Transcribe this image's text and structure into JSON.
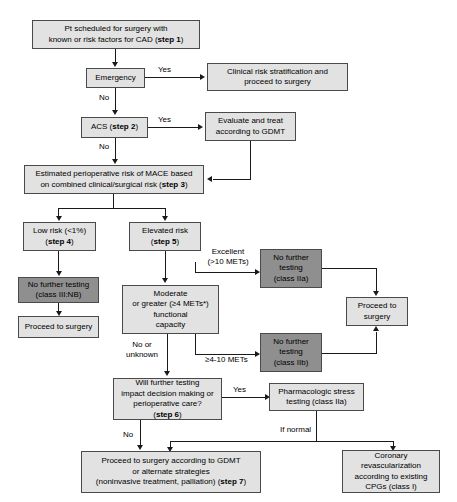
{
  "diagram": {
    "colors": {
      "light_box_fill": "#e2e2e2",
      "dark_box_fill": "#8f8f8f",
      "box_border": "#4a4a4a",
      "connector": "#1a1a1a",
      "text": "#000000",
      "background": "#ffffff"
    },
    "nodes": {
      "step1": {
        "line1": "Pt scheduled for surgery with",
        "line2_pre": "known or risk factors for CAD (",
        "line2_bold": "step 1",
        "line2_post": ")"
      },
      "emergency": {
        "label": "Emergency"
      },
      "clinical_risk": {
        "line1": "Clinical risk stratification and",
        "line2": "proceed to surgery"
      },
      "acs": {
        "pre": "ACS (",
        "bold": "step 2",
        "post": ")"
      },
      "evaluate_gdmt": {
        "line1": "Evaluate and treat",
        "line2": "according to GDMT"
      },
      "step3": {
        "line1": "Estimated perioperative risk of MACE based",
        "line2_pre": "on combined clinical/surgical risk (",
        "line2_bold": "step 3",
        "line2_post": ")"
      },
      "low_risk": {
        "line1": "Low risk (<1%)",
        "line2_pre": "(",
        "line2_bold": "step 4",
        "line2_post": ")"
      },
      "elevated_risk": {
        "line1": "Elevated risk",
        "line2_pre": "(",
        "line2_bold": "step 5",
        "line2_post": ")"
      },
      "no_testing_iiinb": {
        "line1": "No further testing",
        "line2": "(class III:NB)"
      },
      "proceed_surgery_low": {
        "label": "Proceed to surgery"
      },
      "moderate_capacity": {
        "line1": "Moderate",
        "line2": "or greater (≥4 METs*)",
        "line3": "functional",
        "line4": "capacity"
      },
      "no_testing_iia": {
        "line1": "No further",
        "line2": "testing",
        "line3": "(class IIa)"
      },
      "no_testing_iib": {
        "line1": "No further",
        "line2": "testing",
        "line3": "(class IIb)"
      },
      "proceed_surgery_right": {
        "line1": "Proceed to",
        "line2": "surgery"
      },
      "step6": {
        "line1": "Will further testing",
        "line2": "impact decision making or",
        "line3": "perioperative care?",
        "line4_pre": "(",
        "line4_bold": "step 6",
        "line4_post": ")"
      },
      "pharm_stress": {
        "line1": "Pharmacologic stress",
        "line2": "testing (class IIa)"
      },
      "step7": {
        "line1": "Proceed to surgery according to GDMT",
        "line2": "or alternate strategies",
        "line3_pre": "(noninvasive treatment, palliation) (",
        "line3_bold": "step 7",
        "line3_post": ")"
      },
      "coronary_revasc": {
        "line1": "Coronary",
        "line2": "revascularization",
        "line3": "according to existing",
        "line4": "CPGs (class I)"
      }
    },
    "edge_labels": {
      "emergency_yes": "Yes",
      "emergency_no": "No",
      "acs_yes": "Yes",
      "acs_no": "No",
      "excellent_line1": "Excellent",
      "excellent_line2": "(>10 METs)",
      "mets_4_10": "≥4-10 METs",
      "no_or_unknown_line1": "No or",
      "no_or_unknown_line2": "unknown",
      "step6_yes": "Yes",
      "step6_no": "No",
      "if_normal": "If normal"
    }
  }
}
